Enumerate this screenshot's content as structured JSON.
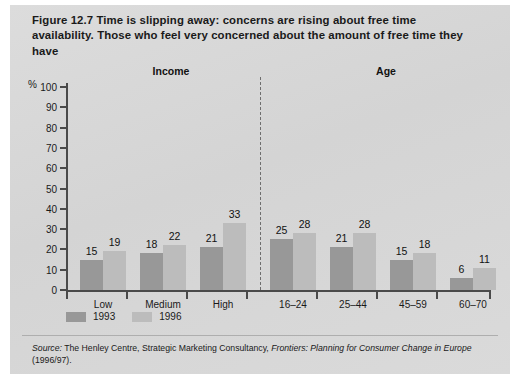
{
  "figure": {
    "title": "Figure 12.7  Time is slipping away: concerns are rising about free time availability. Those who feel very concerned about the amount of free time they have",
    "percent_symbol": "%",
    "source_prefix": "Source:",
    "source_body": " The Henley Centre, Strategic Marketing Consultancy, ",
    "source_italic": "Frontiers: Planning for Consumer Change in Europe",
    "source_suffix": " (1996/97).",
    "colors": {
      "panel": "#d8d8d8",
      "bar_1993": "#989898",
      "bar_1996": "#bcbcbc",
      "axis": "#4a4a4a",
      "text": "#1a1a1a"
    }
  },
  "sections": [
    {
      "label": "Income"
    },
    {
      "label": "Age"
    }
  ],
  "legend": [
    {
      "label": "1993",
      "color": "#989898"
    },
    {
      "label": "1996",
      "color": "#bcbcbc"
    }
  ],
  "chart_data": {
    "type": "bar",
    "title": "Figure 12.7  Time is slipping away: concerns are rising about free time availability. Those who feel very concerned about the amount of free time they have",
    "xlabel": "",
    "ylabel": "%",
    "ylim": [
      0,
      100
    ],
    "yticks": [
      0,
      10,
      20,
      30,
      40,
      50,
      60,
      70,
      80,
      90,
      100
    ],
    "grid": false,
    "legend_position": "bottom-left",
    "categories": [
      "Low",
      "Medium",
      "High",
      "16–24",
      "25–44",
      "45–59",
      "60–70"
    ],
    "groups": [
      "Income",
      "Income",
      "Income",
      "Age",
      "Age",
      "Age",
      "Age"
    ],
    "series": [
      {
        "name": "1993",
        "color": "#989898",
        "values": [
          15,
          18,
          21,
          25,
          21,
          15,
          6
        ]
      },
      {
        "name": "1996",
        "color": "#bcbcbc",
        "values": [
          19,
          22,
          33,
          28,
          28,
          18,
          11
        ]
      }
    ],
    "annotations": [
      "Dashed vertical divider separates the Income groups from the Age groups"
    ]
  }
}
